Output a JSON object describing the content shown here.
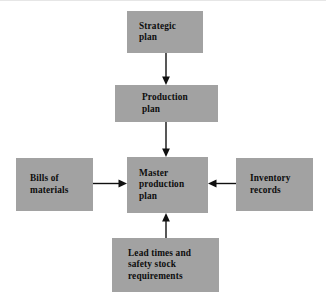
{
  "diagram": {
    "canvas": {
      "width": 326,
      "height": 299
    },
    "colors": {
      "background": "#ffffff",
      "node_fill": "#a2a2a2",
      "node_text": "#0d0d0d",
      "arrow": "#101010"
    },
    "nodes": [
      {
        "id": "strategic-plan",
        "label": "Strategic\nplan",
        "lines": [
          "Strategic",
          "plan"
        ]
      },
      {
        "id": "production-plan",
        "label": "Production\nplan",
        "lines": [
          "Production",
          "plan"
        ]
      },
      {
        "id": "master-production-plan",
        "label": "Master\nproduction\nplan",
        "lines": [
          "Master",
          "production",
          "plan"
        ]
      },
      {
        "id": "bills-of-materials",
        "label": "Bills of\nmaterials",
        "lines": [
          "Bills of",
          "materials"
        ]
      },
      {
        "id": "inventory-records",
        "label": "Inventory\nrecords",
        "lines": [
          "Inventory",
          "records"
        ]
      },
      {
        "id": "lead-times",
        "label": "Lead times and\nsafety stock\nrequirements",
        "lines": [
          "Lead times and",
          "safety stock",
          "requirements"
        ]
      }
    ],
    "edges": [
      {
        "id": "strategic-to-production",
        "from": "strategic-plan",
        "to": "production-plan",
        "direction": "down"
      },
      {
        "id": "production-to-master",
        "from": "production-plan",
        "to": "master-production-plan",
        "direction": "down"
      },
      {
        "id": "bills-to-master",
        "from": "bills-of-materials",
        "to": "master-production-plan",
        "direction": "right"
      },
      {
        "id": "inventory-to-master",
        "from": "inventory-records",
        "to": "master-production-plan",
        "direction": "left"
      },
      {
        "id": "leadtimes-to-master",
        "from": "lead-times",
        "to": "master-production-plan",
        "direction": "up"
      }
    ]
  }
}
